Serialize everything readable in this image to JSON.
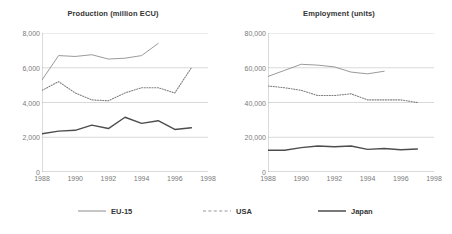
{
  "legend": {
    "position": "bottom",
    "items": [
      {
        "label": "EU-15",
        "style": "solid-thin",
        "color": "#808080"
      },
      {
        "label": "USA",
        "style": "dotted",
        "color": "#808080"
      },
      {
        "label": "Japan",
        "style": "solid-thick",
        "color": "#4d4d4d"
      }
    ]
  },
  "chart_data": [
    {
      "type": "line",
      "title": "Production (million ECU)",
      "xlabel": "",
      "ylabel": "",
      "x": [
        1988,
        1989,
        1990,
        1991,
        1992,
        1993,
        1994,
        1995,
        1996,
        1997
      ],
      "xlim": [
        1988,
        1998
      ],
      "xticks": [
        "1988",
        "1990",
        "1992",
        "1994",
        "1996",
        "1998"
      ],
      "xtick_values": [
        1988,
        1990,
        1992,
        1994,
        1996,
        1998
      ],
      "ylim": [
        0,
        8000
      ],
      "yticks": [
        "0",
        "2,000",
        "4,000",
        "6,000",
        "8,000"
      ],
      "ytick_values": [
        0,
        2000,
        4000,
        6000,
        8000
      ],
      "grid": true,
      "series": [
        {
          "name": "EU-15",
          "style": "solid-thin",
          "color": "#808080",
          "x": [
            1988,
            1989,
            1990,
            1991,
            1992,
            1993,
            1994,
            1995
          ],
          "values": [
            5300,
            6700,
            6650,
            6750,
            6500,
            6550,
            6700,
            7400
          ]
        },
        {
          "name": "USA",
          "style": "dotted",
          "color": "#808080",
          "x": [
            1988,
            1989,
            1990,
            1991,
            1992,
            1993,
            1994,
            1995,
            1996,
            1997
          ],
          "values": [
            4700,
            5200,
            4550,
            4150,
            4100,
            4550,
            4850,
            4850,
            4550,
            6000
          ]
        },
        {
          "name": "Japan",
          "style": "solid-thick",
          "color": "#4d4d4d",
          "x": [
            1988,
            1989,
            1990,
            1991,
            1992,
            1993,
            1994,
            1995,
            1996,
            1997
          ],
          "values": [
            2200,
            2350,
            2400,
            2700,
            2500,
            3150,
            2800,
            2950,
            2450,
            2550
          ]
        }
      ]
    },
    {
      "type": "line",
      "title": "Employment (units)",
      "xlabel": "",
      "ylabel": "",
      "x": [
        1988,
        1989,
        1990,
        1991,
        1992,
        1993,
        1994,
        1995,
        1996,
        1997
      ],
      "xlim": [
        1988,
        1998
      ],
      "xticks": [
        "1988",
        "1990",
        "1992",
        "1994",
        "1996",
        "1998"
      ],
      "xtick_values": [
        1988,
        1990,
        1992,
        1994,
        1996,
        1998
      ],
      "ylim": [
        0,
        80000
      ],
      "yticks": [
        "0",
        "20,000",
        "40,000",
        "60,000",
        "80,000"
      ],
      "ytick_values": [
        0,
        20000,
        40000,
        60000,
        80000
      ],
      "grid": true,
      "series": [
        {
          "name": "EU-15",
          "style": "solid-thin",
          "color": "#808080",
          "x": [
            1988,
            1989,
            1990,
            1991,
            1992,
            1993,
            1994,
            1995
          ],
          "values": [
            55000,
            58500,
            62000,
            61500,
            60500,
            57500,
            56500,
            58000
          ]
        },
        {
          "name": "USA",
          "style": "dotted",
          "color": "#808080",
          "x": [
            1988,
            1989,
            1990,
            1991,
            1992,
            1993,
            1994,
            1995,
            1996,
            1997
          ],
          "values": [
            49500,
            48500,
            47000,
            44000,
            44000,
            45000,
            41500,
            41500,
            41500,
            40000
          ]
        },
        {
          "name": "Japan",
          "style": "solid-thick",
          "color": "#4d4d4d",
          "x": [
            1988,
            1989,
            1990,
            1991,
            1992,
            1993,
            1994,
            1995,
            1996,
            1997
          ],
          "values": [
            12500,
            12500,
            14000,
            15000,
            14500,
            15000,
            13000,
            13500,
            12800,
            13200
          ]
        }
      ]
    }
  ]
}
